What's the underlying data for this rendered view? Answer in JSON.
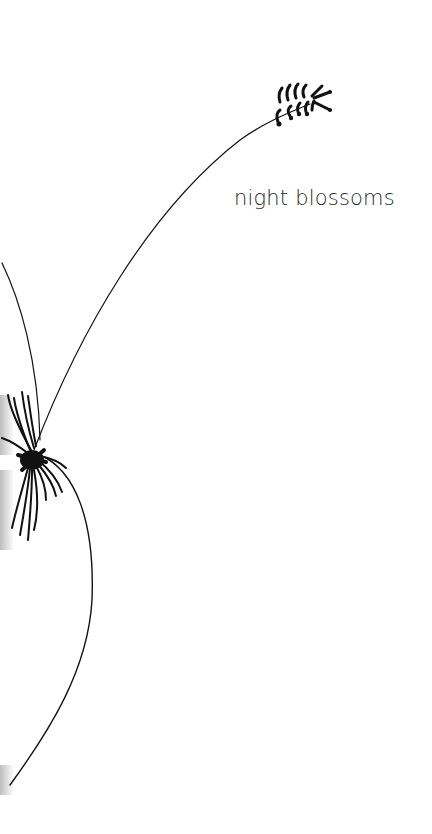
{
  "title": "night blossoms",
  "colors": {
    "background": "#ffffff",
    "ink": "#111111",
    "text": "#2a2a2a",
    "shadow": "#bdbdbd"
  }
}
